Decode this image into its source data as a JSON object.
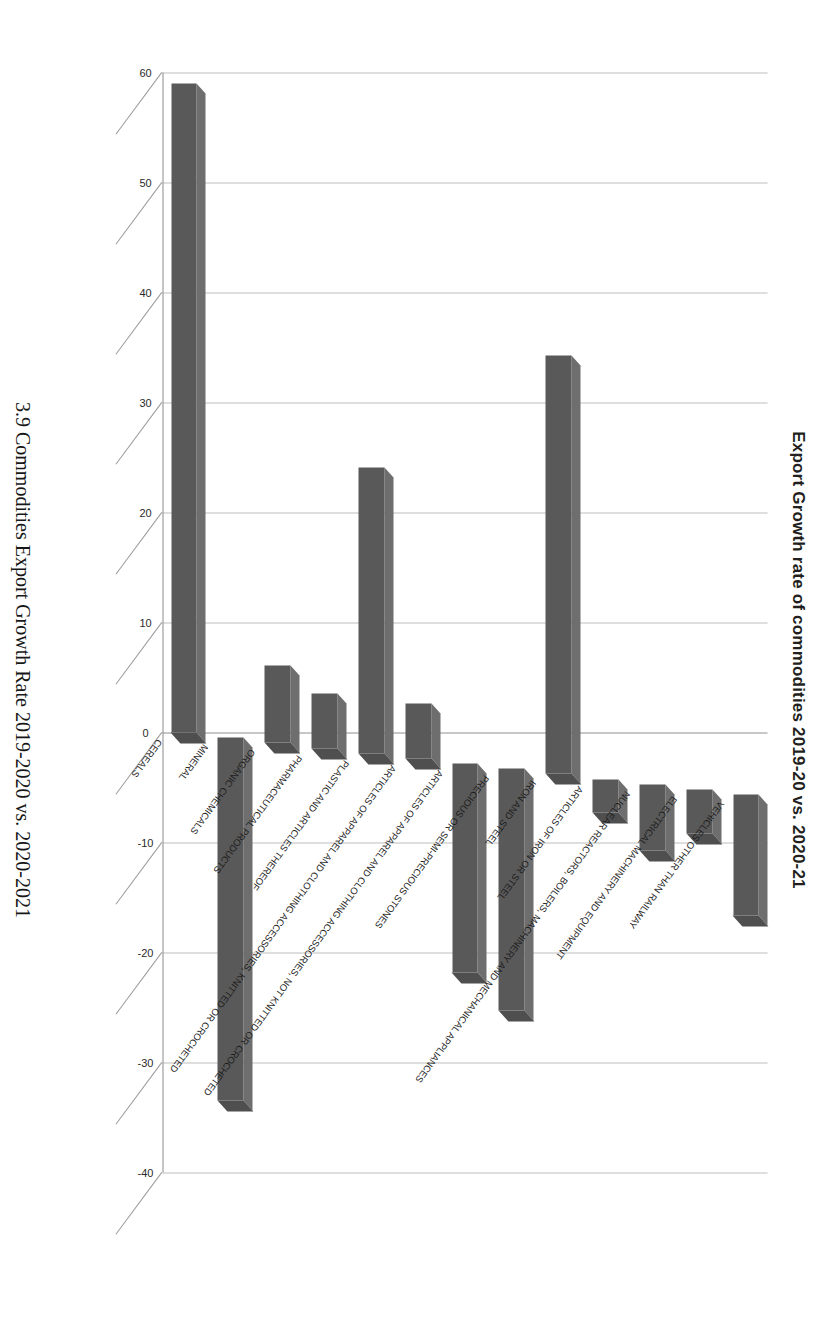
{
  "figure": {
    "title": "Export Growth rate of commodities 2019-20 vs. 2020-21",
    "caption": "3.9 Commodities Export Growth Rate 2019-2020 vs. 2020-2021",
    "legend_label": "Export Growth (%)",
    "series_color": "#595959"
  },
  "chart_data": {
    "type": "bar",
    "title": "Export Growth rate of commodities 2019-20 vs. 2020-21",
    "xlabel": "",
    "ylabel": "Export Growth (%)",
    "orientation": "horizontal",
    "grid": true,
    "legend_position": "top-right",
    "ylim": [
      -40,
      60
    ],
    "tick_labels": [
      "60",
      "50",
      "40",
      "30",
      "20",
      "10",
      "0",
      "-10",
      "-20",
      "-30",
      "-40"
    ],
    "ticks": [
      60,
      50,
      40,
      30,
      20,
      10,
      0,
      -10,
      -20,
      -30,
      -40
    ],
    "categories": [
      "CEREALS",
      "MINERAL",
      "ORGANIC CHEMICALS",
      "PHARMACEUTICAL PRODUCTS",
      "PLASTIC AND ARTICLES THEREOF",
      "ARTICLES OF APPAREL AND CLOTHING ACCESSORIES, KNITTED OR CROCHETED",
      "ARTICLES OF APPAREL AND CLOTHING ACCESSORIES, NOT KNITTED OR CROCHETED",
      "PRECIOUS OR SEMI-PRECIOUS STONES",
      "IRON AND STEEL",
      "ARTICLES OF IRON OR STEEL",
      "NUCLEAR REACTORS, BOILERS, MACHINERY AND MECHANICAL APPLIANCES",
      "ELECTRICAL MACHINERY AND EQUIPMENT",
      "VEHICLES OTHER THAN RAILWAY"
    ],
    "series": [
      {
        "name": "Export Growth (%)",
        "values": [
          59,
          -33,
          7,
          5,
          26,
          5,
          -19,
          -22,
          38,
          -3,
          -6,
          -4,
          -11
        ]
      }
    ]
  }
}
